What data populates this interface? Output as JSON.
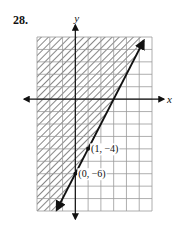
{
  "problem": {
    "number": "28."
  },
  "chart_data": {
    "type": "line",
    "title": "",
    "xlabel": "x",
    "ylabel": "y",
    "xlim": [
      -3,
      6
    ],
    "ylim": [
      -9,
      5
    ],
    "grid": true,
    "grid_step": 1,
    "boundary_line": {
      "equation": "y = 2x - 6",
      "slope": 2,
      "intercept": -6,
      "style": "solid",
      "arrows": "both"
    },
    "shading": {
      "region": "above/left of line",
      "inequality": "y >= 2x - 6",
      "pattern": "diagonal hatch"
    },
    "points": [
      {
        "x": 1,
        "y": -4,
        "label": "(1, −4)"
      },
      {
        "x": 0,
        "y": -6,
        "label": "(0, −6)"
      }
    ]
  }
}
